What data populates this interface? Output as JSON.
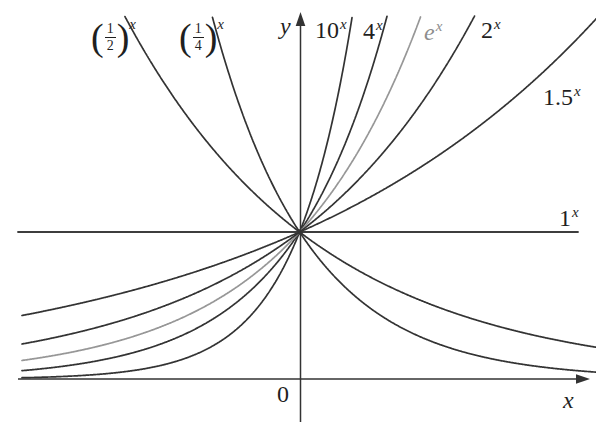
{
  "figure": {
    "background": "#ffffff",
    "text_color": "#1f1f1f",
    "curve_color": "#333333",
    "one_line_color": "#3d3d3d",
    "highlight_curve_color": "#979797",
    "highlight_label_color": "#8d8d8d",
    "axis_color": "#333333"
  },
  "axes": {
    "y_label": "y",
    "x_label": "x",
    "origin_label": "0"
  },
  "labels": {
    "paren_open": "(",
    "paren_close": ")",
    "half": {
      "num": "1",
      "den": "2",
      "sup": "x"
    },
    "quarter": {
      "num": "1",
      "den": "4",
      "sup": "x"
    },
    "ten": {
      "base": "10",
      "sup": "x"
    },
    "four": {
      "base": "4",
      "sup": "x"
    },
    "e": {
      "base": "e",
      "sup": "x"
    },
    "two": {
      "base": "2",
      "sup": "x"
    },
    "one_point_five": {
      "base": "1.5",
      "sup": "x"
    },
    "one": {
      "base": "1",
      "sup": "x"
    }
  },
  "chart_data": {
    "type": "line",
    "title": "",
    "xlabel": "x",
    "ylabel": "y",
    "x_range": [
      -2.07,
      2.21
    ],
    "y_range": [
      0,
      2.47
    ],
    "grid": false,
    "legend_position": "labels beside each curve",
    "common_point": [
      0,
      1
    ],
    "series": [
      {
        "name": "(1/2)^x",
        "base": 0.5,
        "highlight": false
      },
      {
        "name": "(1/4)^x",
        "base": 0.25,
        "highlight": false
      },
      {
        "name": "10^x",
        "base": 10,
        "highlight": false
      },
      {
        "name": "4^x",
        "base": 4,
        "highlight": false
      },
      {
        "name": "e^x",
        "base": 2.718281828,
        "highlight": true
      },
      {
        "name": "2^x",
        "base": 2,
        "highlight": false
      },
      {
        "name": "1.5^x",
        "base": 1.5,
        "highlight": false
      },
      {
        "name": "1^x",
        "base": 1,
        "highlight": false
      }
    ]
  }
}
